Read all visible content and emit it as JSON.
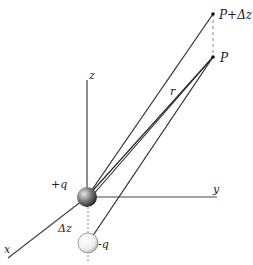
{
  "diagram": {
    "labels": {
      "z_axis": "z",
      "y_axis": "y",
      "x_axis": "x",
      "point_p": "P",
      "point_p_dz": "P+Δz",
      "distance": "r",
      "positive_charge": "+q",
      "negative_charge": "-q",
      "separation": "Δz"
    },
    "colors": {
      "line": "#2a2a2a",
      "dashed": "#888888",
      "sphere_pos_light": "#d0d0d0",
      "sphere_pos_dark": "#333333",
      "sphere_neg_light": "#ffffff",
      "sphere_neg_dark": "#b8b8b8"
    }
  }
}
